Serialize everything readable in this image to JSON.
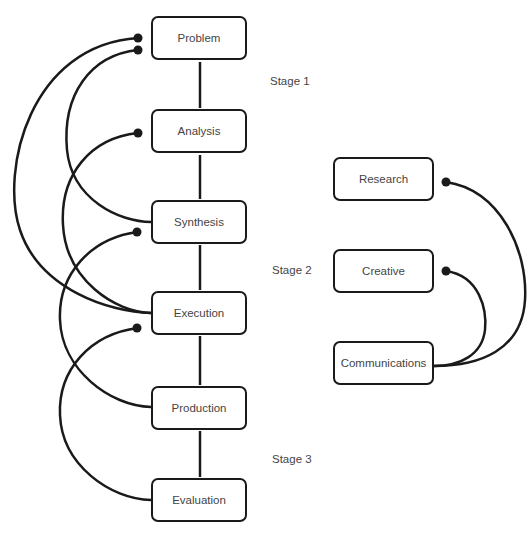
{
  "diagram": {
    "process_nodes": [
      {
        "id": "problem",
        "label": "Problem"
      },
      {
        "id": "analysis",
        "label": "Analysis"
      },
      {
        "id": "synthesis",
        "label": "Synthesis"
      },
      {
        "id": "execution",
        "label": "Execution"
      },
      {
        "id": "production",
        "label": "Production"
      },
      {
        "id": "evaluation",
        "label": "Evaluation"
      }
    ],
    "team_nodes": [
      {
        "id": "research",
        "label": "Research"
      },
      {
        "id": "creative",
        "label": "Creative"
      },
      {
        "id": "communications",
        "label": "Communications"
      }
    ],
    "stages": [
      {
        "label": "Stage 1"
      },
      {
        "label": "Stage 2"
      },
      {
        "label": "Stage 3"
      }
    ],
    "edges": [
      {
        "from": "problem",
        "to": "analysis",
        "type": "straight"
      },
      {
        "from": "analysis",
        "to": "synthesis",
        "type": "straight"
      },
      {
        "from": "synthesis",
        "to": "execution",
        "type": "straight"
      },
      {
        "from": "execution",
        "to": "production",
        "type": "straight"
      },
      {
        "from": "production",
        "to": "evaluation",
        "type": "straight"
      },
      {
        "from": "execution",
        "to": "problem",
        "type": "arc"
      },
      {
        "from": "synthesis",
        "to": "problem",
        "type": "arc"
      },
      {
        "from": "execution",
        "to": "analysis",
        "type": "arc"
      },
      {
        "from": "production",
        "to": "synthesis",
        "type": "arc"
      },
      {
        "from": "evaluation",
        "to": "execution",
        "type": "arc"
      },
      {
        "from": "communications",
        "to": "research",
        "type": "arc"
      },
      {
        "from": "communications",
        "to": "creative",
        "type": "arc"
      }
    ],
    "colors": {
      "line": "#1a1a1a",
      "text": "#444444",
      "background": "#ffffff"
    }
  }
}
